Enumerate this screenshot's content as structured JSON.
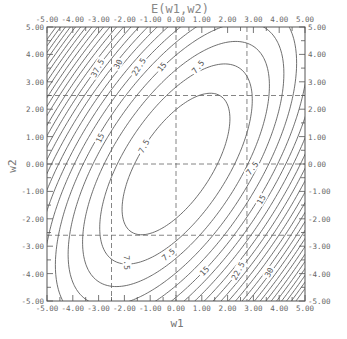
{
  "chart_data": {
    "type": "contour",
    "title": "E(w1,w2)",
    "xlabel": "w1",
    "ylabel": "w2",
    "xlim": [
      -5.0,
      5.0
    ],
    "ylim": [
      -5.0,
      5.0
    ],
    "x_ticks": [
      "-5.00",
      "-4.00",
      "-3.00",
      "-2.00",
      "-1.00",
      "0.00",
      "1.00",
      "2.00",
      "3.00",
      "4.00",
      "5.00"
    ],
    "y_ticks": [
      "5.00",
      "4.00",
      "3.00",
      "2.00",
      "1.00",
      "0.00",
      "-1.00",
      "-2.00",
      "-3.00",
      "-4.00",
      "-5.00"
    ],
    "minor_ticks_per_unit": 2,
    "contour_levels": [
      3.75,
      7.5,
      11.25,
      15,
      18.75,
      22.5,
      26.25,
      30,
      33.75,
      37.5,
      41.25,
      45,
      48.75,
      52.5,
      56.25,
      60,
      63.75,
      67.5,
      71.25,
      75,
      78.75,
      82.5,
      86.25,
      90
    ],
    "labeled_levels": [
      "7.5",
      "15",
      "22.5",
      "30",
      "37.5"
    ],
    "function": {
      "form": "a*w1^2 + b*w2^2 - c*w1*w2",
      "a": 1.45,
      "b": 0.95,
      "c": 1.5
    },
    "dashed_guides": {
      "w1": [
        -2.5,
        0.0,
        2.75
      ],
      "w2": [
        2.5,
        0.0,
        -2.6
      ]
    },
    "contour_labels": [
      {
        "text": "37.5",
        "w1": -3.05,
        "w2": 3.5,
        "angle": -62
      },
      {
        "text": "30",
        "w1": -2.25,
        "w2": 3.65,
        "angle": -62
      },
      {
        "text": "22.5",
        "w1": -1.45,
        "w2": 3.55,
        "angle": -58
      },
      {
        "text": "15",
        "w1": -0.55,
        "w2": 3.55,
        "angle": -50
      },
      {
        "text": "7.5",
        "w1": 0.85,
        "w2": 3.55,
        "angle": -50
      },
      {
        "text": "15",
        "w1": -2.95,
        "w2": 0.95,
        "angle": -65
      },
      {
        "text": "7.5",
        "w1": -1.25,
        "w2": 0.65,
        "angle": -62
      },
      {
        "text": "7.5",
        "w1": 2.95,
        "w2": -0.15,
        "angle": -52
      },
      {
        "text": "15",
        "w1": 3.3,
        "w2": -1.3,
        "angle": -60
      },
      {
        "text": "7.5",
        "w1": -1.9,
        "w2": -3.6,
        "angle": 88
      },
      {
        "text": "7.5",
        "w1": -0.3,
        "w2": -3.3,
        "angle": -40
      },
      {
        "text": "15",
        "w1": 1.1,
        "w2": -3.9,
        "angle": -45
      },
      {
        "text": "22.5",
        "w1": 2.4,
        "w2": -3.9,
        "angle": -62
      },
      {
        "text": "30",
        "w1": 3.6,
        "w2": -3.95,
        "angle": -62
      }
    ]
  },
  "colors": {
    "line": "#4a4a4a",
    "frame": "#555555",
    "dash": "#666666",
    "background": "#ffffff"
  }
}
